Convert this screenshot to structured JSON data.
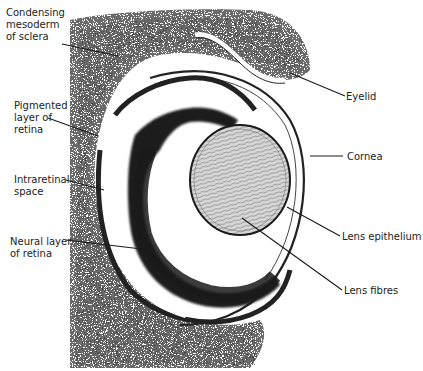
{
  "figure": {
    "labels": {
      "condensing_mesoderm": "Condensing\nmesoderm\nof sclera",
      "pigmented_layer": "Pigmented\nlayer of\nretina",
      "intraretinal_space": "Intraretinal\nspace",
      "neural_layer": "Neural layer\nof retina",
      "eyelid": "Eyelid",
      "cornea": "Cornea",
      "lens_epithelium": "Lens epithelium",
      "lens_fibres": "Lens fibres"
    },
    "colors": {
      "background": "#ffffff",
      "tissue_dark": "#2a2a2a",
      "tissue_mid": "#8a8a8a",
      "leader_line": "#1a1a1a"
    }
  }
}
